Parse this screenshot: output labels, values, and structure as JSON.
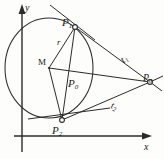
{
  "figure": {
    "stroke_color": "#2b2b2b",
    "background_color": "#fdfdfb",
    "axes": {
      "x_label": "x",
      "y_label": "y",
      "origin": {
        "x": 22,
        "y": 136
      }
    },
    "circle": {
      "name": "circle-k",
      "center_label": "M",
      "radius_label": "r",
      "center": {
        "x": 49,
        "y": 68
      },
      "rx": 44,
      "ry": 50
    },
    "points": [
      {
        "key": "p1",
        "label": "P",
        "sub": "1",
        "x": 75,
        "y": 27
      },
      {
        "key": "p2",
        "label": "P",
        "sub": "2",
        "x": 62,
        "y": 120
      },
      {
        "key": "p0_external",
        "label": "P",
        "sub": "0",
        "x": 150,
        "y": 82
      },
      {
        "key": "p0_interior",
        "label": "P",
        "sub": "0",
        "x": 72,
        "y": 82
      }
    ],
    "tangents": [
      {
        "key": "t1",
        "label": "t",
        "sub": "1",
        "from": "p1",
        "to": "p0_external"
      },
      {
        "key": "t2",
        "label": "t",
        "sub": "2",
        "from": "p2",
        "to": "p0_external"
      }
    ],
    "segments": [
      {
        "key": "radius-m-p1",
        "label": "r"
      },
      {
        "key": "radius-m-p2",
        "label": ""
      },
      {
        "key": "chord-p1-p2",
        "label": ""
      },
      {
        "key": "line-m-p0",
        "label": ""
      }
    ]
  }
}
